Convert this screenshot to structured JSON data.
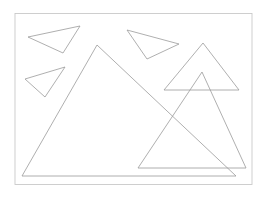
{
  "figure": {
    "canvas": {
      "width": 267,
      "height": 200,
      "background_color": "#ffffff"
    },
    "frame": {
      "name": "plot-border-frame",
      "x": 15,
      "y": 13.5,
      "width": 237,
      "height": 171,
      "stroke_color": "#c9c9c9",
      "stroke_width": 0.9
    },
    "default_stroke_color": "#9a9a9a",
    "default_stroke_width": 0.8,
    "shape_count": 6,
    "shapes": [
      {
        "id": "triangle-1",
        "label": "top-left-small-triangle",
        "points": "28,37 80,26 63,53",
        "vertices": [
          [
            28,
            37
          ],
          [
            80,
            26
          ],
          [
            63,
            53
          ]
        ],
        "stroke_color": "#9a9a9a",
        "stroke_width": 0.8
      },
      {
        "id": "triangle-2",
        "label": "left-middle-small-triangle",
        "points": "25,79 65,67 45,97",
        "vertices": [
          [
            25,
            79
          ],
          [
            65,
            67
          ],
          [
            45,
            97
          ]
        ],
        "stroke_color": "#9a9a9a",
        "stroke_width": 0.8
      },
      {
        "id": "triangle-3",
        "label": "top-middle-small-triangle",
        "points": "127,30 179,44 147,59",
        "vertices": [
          [
            127,
            30
          ],
          [
            179,
            44
          ],
          [
            147,
            59
          ]
        ],
        "stroke_color": "#9a9a9a",
        "stroke_width": 0.8
      },
      {
        "id": "triangle-4",
        "label": "large-left-triangle",
        "points": "97,45 236,176 22,176",
        "vertices": [
          [
            97,
            45
          ],
          [
            236,
            176
          ],
          [
            22,
            176
          ]
        ],
        "stroke_color": "#9a9a9a",
        "stroke_width": 0.8
      },
      {
        "id": "triangle-5",
        "label": "right-medium-triangle",
        "points": "203,43 239,90 164,90",
        "vertices": [
          [
            203,
            43
          ],
          [
            239,
            90
          ],
          [
            164,
            90
          ]
        ],
        "stroke_color": "#9a9a9a",
        "stroke_width": 0.8
      },
      {
        "id": "triangle-6",
        "label": "right-tall-triangle",
        "points": "202,72 246,168 138,168",
        "vertices": [
          [
            202,
            72
          ],
          [
            246,
            168
          ],
          [
            138,
            168
          ]
        ],
        "stroke_color": "#9a9a9a",
        "stroke_width": 0.8
      }
    ]
  }
}
